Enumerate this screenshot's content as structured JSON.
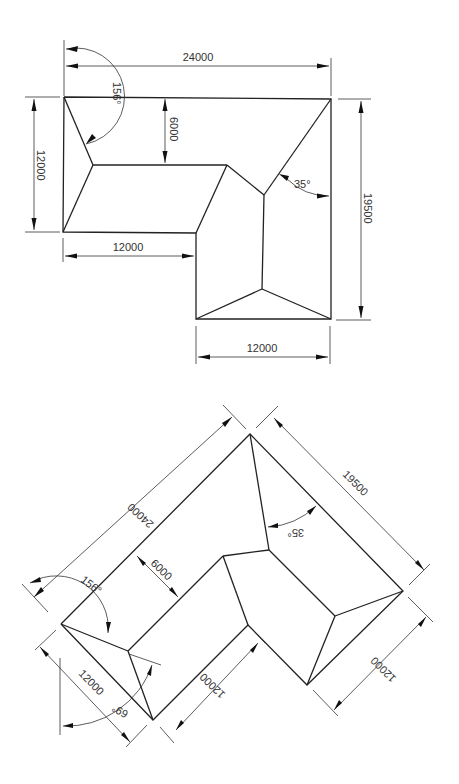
{
  "plan_view": {
    "dims": {
      "overall_width": "24000",
      "left_height": "12000",
      "ridge_offset": "6000",
      "bottom_left_width": "12000",
      "bottom_right_width": "12000",
      "overall_height": "19500"
    },
    "angles": {
      "left_hip": "156°",
      "valley": "35°"
    }
  },
  "rotated_view": {
    "dims": {
      "overall_width": "24000",
      "overall_height": "19500",
      "ridge_offset": "6000",
      "left_width": "12000",
      "lower_width": "12000",
      "right_width": "12000"
    },
    "angles": {
      "left_hip": "156°",
      "lower_hip": "69°",
      "valley": "35°"
    }
  }
}
